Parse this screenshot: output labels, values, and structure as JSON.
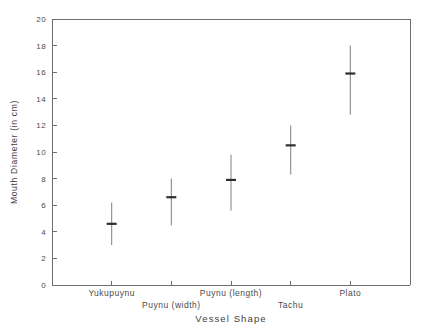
{
  "chart_data": {
    "type": "scatter",
    "title": "",
    "xlabel": "Vessel Shape",
    "ylabel": "Mouth Diameter (in cm)",
    "categories": [
      "Yukupuynu",
      "Puynu (width)",
      "Puynu (length)",
      "Tachu",
      "Plato"
    ],
    "values": [
      4.6,
      6.6,
      7.9,
      10.5,
      15.9
    ],
    "errors_low": [
      3.0,
      4.5,
      5.6,
      8.3,
      12.8
    ],
    "errors_high": [
      6.2,
      8.0,
      9.8,
      12.0,
      18.0
    ],
    "ylim": [
      0,
      20
    ],
    "ytick_labels": [
      "0",
      "2",
      "4",
      "6",
      "8",
      "10",
      "12",
      "14",
      "16",
      "18",
      "20"
    ],
    "ytick_values": [
      0,
      2,
      4,
      6,
      8,
      10,
      12,
      14,
      16,
      18,
      20
    ],
    "grid": false,
    "legend": "none",
    "marker_style": "error-bar-with-mean-tick",
    "axis_color": "#6e6e6e",
    "error_bar_color": "#8a8a8a",
    "mean_marker_color": "#2e2e2e"
  }
}
